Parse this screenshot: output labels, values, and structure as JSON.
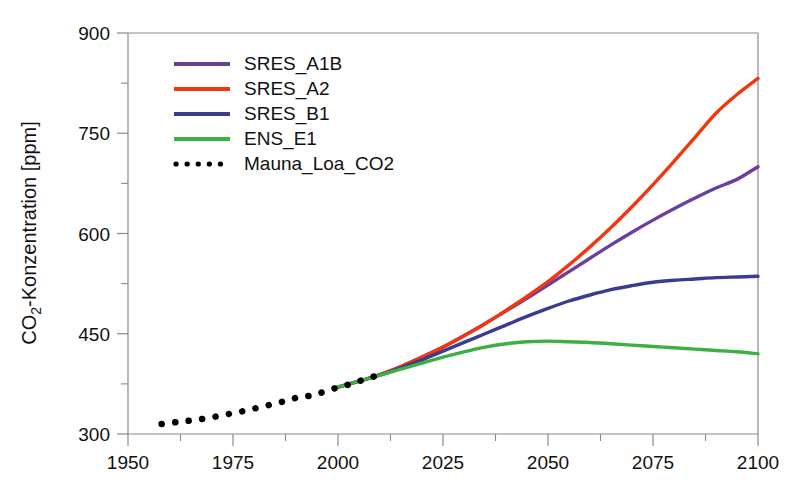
{
  "chart_data": {
    "type": "line",
    "title": "",
    "subtitle": "",
    "xlabel": "",
    "ylabel": "CO2-Konzentration [ppm]",
    "ylabel_prefix": "CO",
    "ylabel_subscript": "2",
    "ylabel_suffix": "-Konzentration [ppm]",
    "xlim": [
      1950,
      2100
    ],
    "ylim": [
      300,
      900
    ],
    "x_ticks": [
      1950,
      1975,
      2000,
      2025,
      2050,
      2075,
      2100
    ],
    "x_tick_labels": [
      "1950",
      "1975",
      "2000",
      "2025",
      "2050",
      "2075",
      "2100"
    ],
    "x_minor_ticks": [
      1962.5,
      1987.5,
      2012.5,
      2037.5,
      2062.5,
      2087.5
    ],
    "y_ticks": [
      300,
      450,
      600,
      750,
      900
    ],
    "y_tick_labels": [
      "300",
      "450",
      "600",
      "750",
      "900"
    ],
    "y_minor_ticks": [
      375,
      525,
      675,
      825
    ],
    "grid": false,
    "legend_position": "top-left",
    "series": [
      {
        "name": "SRES_A1B",
        "color": "#6B3FA0",
        "style": "solid",
        "x": [
          2000,
          2005,
          2010,
          2015,
          2020,
          2025,
          2030,
          2035,
          2040,
          2045,
          2050,
          2055,
          2060,
          2065,
          2070,
          2075,
          2080,
          2085,
          2090,
          2095,
          2100
        ],
        "values": [
          370,
          379,
          389,
          401,
          415,
          430,
          447,
          465,
          484,
          503,
          523,
          543,
          563,
          583,
          602,
          620,
          637,
          653,
          668,
          681,
          700
        ]
      },
      {
        "name": "SRES_A2",
        "color": "#F0370F",
        "style": "solid",
        "x": [
          2000,
          2005,
          2010,
          2015,
          2020,
          2025,
          2030,
          2035,
          2040,
          2045,
          2050,
          2055,
          2060,
          2065,
          2070,
          2075,
          2080,
          2085,
          2090,
          2095,
          2100
        ],
        "values": [
          370,
          379,
          389,
          401,
          415,
          430,
          447,
          465,
          485,
          506,
          528,
          553,
          580,
          609,
          640,
          673,
          708,
          744,
          780,
          808,
          832
        ]
      },
      {
        "name": "SRES_B1",
        "color": "#3B3B8F",
        "style": "solid",
        "x": [
          2000,
          2005,
          2010,
          2015,
          2020,
          2025,
          2030,
          2035,
          2040,
          2045,
          2050,
          2055,
          2060,
          2065,
          2070,
          2075,
          2080,
          2085,
          2090,
          2095,
          2100
        ],
        "values": [
          370,
          379,
          388,
          399,
          411,
          424,
          437,
          450,
          463,
          476,
          488,
          499,
          508,
          516,
          522,
          527,
          530,
          532,
          534,
          535,
          536
        ]
      },
      {
        "name": "ENS_E1",
        "color": "#3CB043",
        "style": "solid",
        "x": [
          2000,
          2005,
          2010,
          2015,
          2020,
          2025,
          2030,
          2035,
          2040,
          2045,
          2050,
          2055,
          2060,
          2065,
          2070,
          2075,
          2080,
          2085,
          2090,
          2095,
          2100
        ],
        "values": [
          370,
          379,
          388,
          397,
          406,
          415,
          423,
          430,
          435,
          438,
          439,
          438,
          437,
          435,
          433,
          431,
          429,
          427,
          425,
          423,
          420
        ]
      },
      {
        "name": "Mauna_Loa_CO2",
        "color": "#000000",
        "style": "dotted",
        "x": [
          1958,
          1962,
          1966,
          1970,
          1974,
          1978,
          1982,
          1986,
          1990,
          1994,
          1998,
          2002,
          2006,
          2010
        ],
        "values": [
          315,
          318,
          321,
          325,
          330,
          335,
          341,
          347,
          354,
          358,
          366,
          373,
          381,
          389
        ]
      }
    ]
  },
  "legend": {
    "items": [
      {
        "label": "SRES_A1B",
        "color": "#6B3FA0",
        "style": "solid"
      },
      {
        "label": "SRES_A2",
        "color": "#F0370F",
        "style": "solid"
      },
      {
        "label": "SRES_B1",
        "color": "#3B3B8F",
        "style": "solid"
      },
      {
        "label": "ENS_E1",
        "color": "#3CB043",
        "style": "solid"
      },
      {
        "label": "Mauna_Loa_CO2",
        "color": "#000000",
        "style": "dotted"
      }
    ]
  }
}
